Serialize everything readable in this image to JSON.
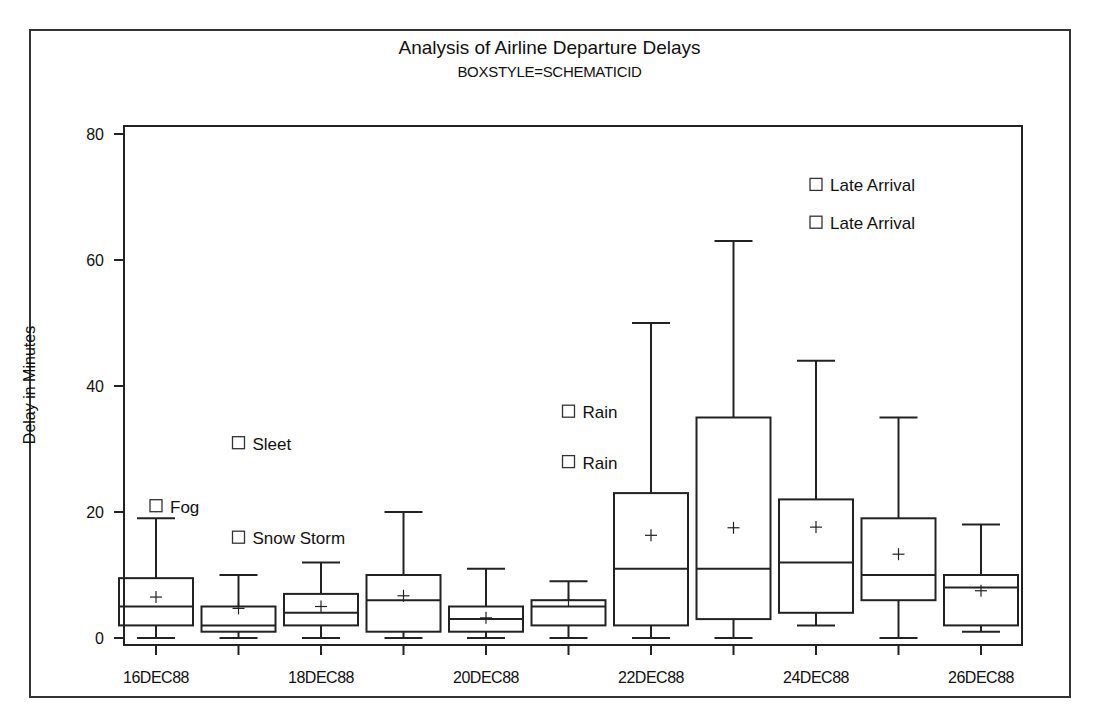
{
  "chart_data": {
    "type": "boxplot",
    "title": "Analysis of Airline Departure Delays",
    "subtitle": "BOXSTYLE=SCHEMATICID",
    "xlabel": "",
    "ylabel": "Delay in Minutes",
    "ylim": [
      0,
      80
    ],
    "yticks": [
      0,
      20,
      40,
      60,
      80
    ],
    "xtick_labels": [
      "16DEC88",
      "18DEC88",
      "20DEC88",
      "22DEC88",
      "24DEC88",
      "26DEC88"
    ],
    "categories": [
      "16DEC88",
      "17DEC88",
      "18DEC88",
      "19DEC88",
      "20DEC88",
      "21DEC88",
      "22DEC88",
      "23DEC88",
      "24DEC88",
      "25DEC88",
      "26DEC88"
    ],
    "boxes": [
      {
        "date": "16DEC88",
        "whisker_low": 0,
        "q1": 2,
        "median": 5,
        "q3": 9.5,
        "whisker_high": 19,
        "mean": 6.5,
        "outliers": [
          {
            "value": 21,
            "label": "Fog"
          }
        ]
      },
      {
        "date": "17DEC88",
        "whisker_low": 0,
        "q1": 1,
        "median": 2,
        "q3": 5,
        "whisker_high": 10,
        "mean": 4.7,
        "outliers": [
          {
            "value": 31,
            "label": "Sleet"
          },
          {
            "value": 16,
            "label": "Snow Storm"
          }
        ]
      },
      {
        "date": "18DEC88",
        "whisker_low": 0,
        "q1": 2,
        "median": 4,
        "q3": 7,
        "whisker_high": 12,
        "mean": 5,
        "outliers": []
      },
      {
        "date": "19DEC88",
        "whisker_low": 0,
        "q1": 1,
        "median": 6,
        "q3": 10,
        "whisker_high": 20,
        "mean": 6.7,
        "outliers": []
      },
      {
        "date": "20DEC88",
        "whisker_low": 0,
        "q1": 1,
        "median": 3,
        "q3": 5,
        "whisker_high": 11,
        "mean": 3.2,
        "outliers": []
      },
      {
        "date": "21DEC88",
        "whisker_low": 0,
        "q1": 2,
        "median": 5,
        "q3": 6,
        "whisker_high": 9,
        "mean": 6,
        "outliers": [
          {
            "value": 36,
            "label": "Rain"
          },
          {
            "value": 28,
            "label": "Rain"
          }
        ]
      },
      {
        "date": "22DEC88",
        "whisker_low": 0,
        "q1": 2,
        "median": 11,
        "q3": 23,
        "whisker_high": 50,
        "mean": 16.3,
        "outliers": []
      },
      {
        "date": "23DEC88",
        "whisker_low": 0,
        "q1": 3,
        "median": 11,
        "q3": 35,
        "whisker_high": 63,
        "mean": 17.5,
        "outliers": []
      },
      {
        "date": "24DEC88",
        "whisker_low": 2,
        "q1": 4,
        "median": 12,
        "q3": 22,
        "whisker_high": 44,
        "mean": 17.6,
        "outliers": [
          {
            "value": 72,
            "label": "Late Arrival"
          },
          {
            "value": 66,
            "label": "Late Arrival"
          }
        ]
      },
      {
        "date": "25DEC88",
        "whisker_low": 0,
        "q1": 6,
        "median": 10,
        "q3": 19,
        "whisker_high": 35,
        "mean": 13.3,
        "outliers": []
      },
      {
        "date": "26DEC88",
        "whisker_low": 1,
        "q1": 2,
        "median": 8,
        "q3": 10,
        "whisker_high": 18,
        "mean": 7.5,
        "outliers": []
      }
    ],
    "grid": false,
    "legend": null
  }
}
